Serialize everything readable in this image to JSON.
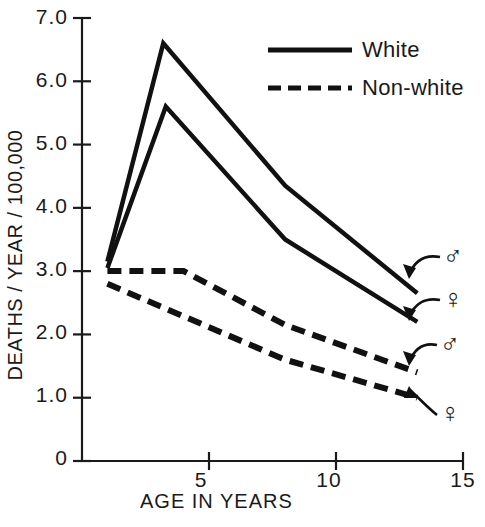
{
  "figure": {
    "background": "#ffffff",
    "ink": "#111111"
  },
  "axes": {
    "y": {
      "label": "DEATHS / YEAR / 100,000",
      "ticks": [
        "0",
        "1.0",
        "2.0",
        "3.0",
        "4.0",
        "5.0",
        "6.0",
        "7.0"
      ],
      "min": 0,
      "max": 7.0
    },
    "x": {
      "label": "AGE IN YEARS",
      "ticks": [
        "5",
        "10",
        "15"
      ],
      "min": 0,
      "max": 15
    }
  },
  "legend": {
    "position": "top-right",
    "items": [
      {
        "label": "White",
        "style": "solid"
      },
      {
        "label": "Non-white",
        "style": "dashed"
      }
    ]
  },
  "annotations": [
    {
      "name": "white-male-marker",
      "symbol": "♂",
      "series": "White male"
    },
    {
      "name": "white-female-marker",
      "symbol": "♀",
      "series": "White female"
    },
    {
      "name": "nonwhite-male-marker",
      "symbol": "♂",
      "series": "Non-white male"
    },
    {
      "name": "nonwhite-female-marker",
      "symbol": "♀",
      "series": "Non-white female"
    }
  ],
  "chart_data": {
    "type": "line",
    "title": "",
    "xlabel": "AGE IN YEARS",
    "ylabel": "DEATHS / YEAR / 100,000",
    "xlim": [
      0,
      15
    ],
    "ylim": [
      0,
      7.0
    ],
    "grid": false,
    "legend_position": "top-right",
    "series": [
      {
        "name": "White male",
        "race": "White",
        "sex": "male",
        "style": "solid",
        "symbol": "♂",
        "x": [
          1,
          3.2,
          8,
          13.2
        ],
        "y": [
          3.15,
          6.6,
          4.35,
          2.65
        ]
      },
      {
        "name": "White female",
        "race": "White",
        "sex": "female",
        "style": "solid",
        "symbol": "♀",
        "x": [
          1,
          3.3,
          8,
          13.2
        ],
        "y": [
          3.05,
          5.6,
          3.5,
          2.2
        ]
      },
      {
        "name": "Non-white male",
        "race": "Non-white",
        "sex": "male",
        "style": "dashed",
        "symbol": "♂",
        "x": [
          1,
          4,
          8,
          13.2
        ],
        "y": [
          3.0,
          3.0,
          2.15,
          1.4
        ]
      },
      {
        "name": "Non-white female",
        "race": "Non-white",
        "sex": "female",
        "style": "dashed",
        "symbol": "♀",
        "x": [
          1,
          8,
          13.2
        ],
        "y": [
          2.8,
          1.6,
          1.0
        ]
      }
    ]
  }
}
